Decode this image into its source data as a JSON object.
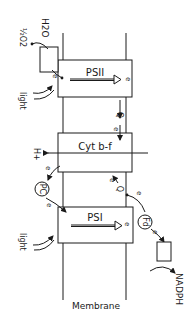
{
  "diagram": {
    "membrane_label": "Membrane",
    "complexes": {
      "psii": "PSII",
      "cytbf": "Cyt b-f",
      "psi": "PSI"
    },
    "carriers": {
      "pc": "PC",
      "fd": "Fd",
      "q_top": "Q",
      "q_bottom": "Q"
    },
    "inputs": {
      "h2o": "H2O",
      "o2": "½O2",
      "light_top": "light",
      "light_bottom": "light",
      "proton": "H+",
      "nadph": "NADPH"
    },
    "electron_label": "e",
    "colors": {
      "ink": "#1a1a1a",
      "background": "#ffffff"
    }
  }
}
